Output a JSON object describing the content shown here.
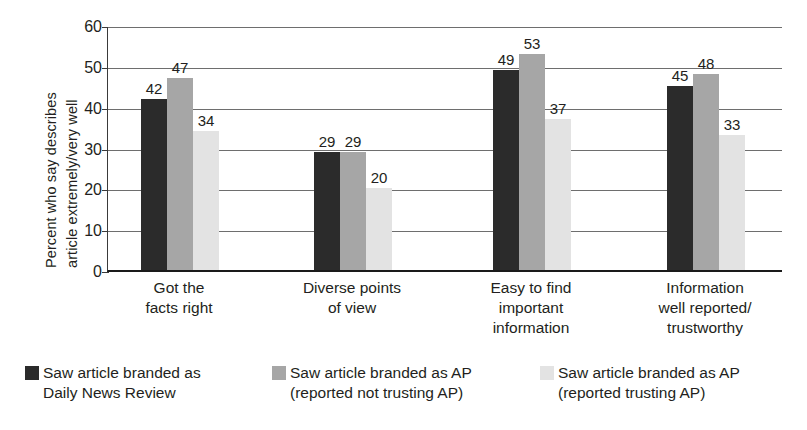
{
  "chart_data": {
    "type": "bar",
    "title": "",
    "subtitle": "",
    "xlabel": "",
    "ylabel": "Percent who say describes article extremely/very well",
    "ylabel_lines": [
      "Percent who say describes",
      "article extremely/very well"
    ],
    "ylim": [
      0,
      60
    ],
    "ytick_values": [
      0,
      10,
      20,
      30,
      40,
      50,
      60
    ],
    "ytick_labels": [
      "0",
      "10",
      "20",
      "30",
      "40",
      "50",
      "60"
    ],
    "grid": true,
    "grid_axis": "y",
    "legend_position": "bottom",
    "categories": [
      "Got the facts right",
      "Diverse points of view",
      "Easy to find important information",
      "Information well reported/ trustworthy"
    ],
    "category_lines": [
      [
        "Got the",
        "facts right"
      ],
      [
        "Diverse points",
        "of view"
      ],
      [
        "Easy to find",
        "important",
        "information"
      ],
      [
        "Information",
        "well reported/",
        "trustworthy"
      ]
    ],
    "series": [
      {
        "name": "Saw article branded as Daily News Review",
        "name_lines": [
          "Saw article branded as",
          "Daily News Review"
        ],
        "color": "#2b2b2b",
        "values": [
          42,
          29,
          49,
          45
        ]
      },
      {
        "name": "Saw article branded as AP (reported not trusting AP)",
        "name_lines": [
          "Saw article branded as AP",
          "(reported not trusting AP)"
        ],
        "color": "#a6a6a6",
        "values": [
          47,
          29,
          53,
          48
        ]
      },
      {
        "name": "Saw article branded as AP (reported trusting AP)",
        "name_lines": [
          "Saw article branded as AP",
          "(reported trusting AP)"
        ],
        "color": "#e3e3e3",
        "values": [
          34,
          20,
          37,
          33
        ]
      }
    ]
  },
  "colors": {
    "series_dark": "#2b2b2b",
    "series_mid": "#a6a6a6",
    "series_light": "#e3e3e3",
    "axis": "#1a1a1a",
    "grid": "#6e6e6e",
    "text": "#231f20",
    "background": "#ffffff"
  }
}
